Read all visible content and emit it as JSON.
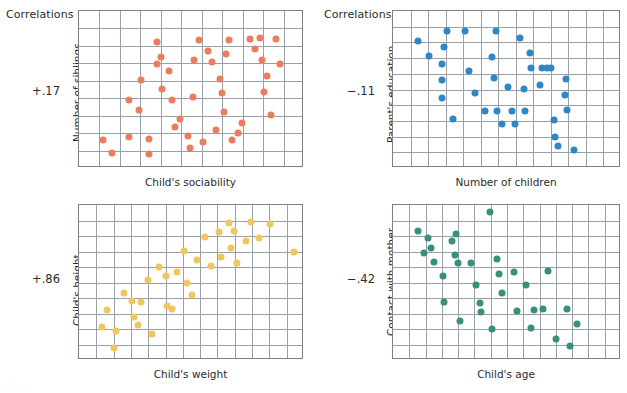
{
  "figure": {
    "caption_label": "Correlations",
    "footer_note": "Figure"
  },
  "colors": {
    "orange": "#EA7D5E",
    "blue": "#2F86C5",
    "yellow": "#F0C65E",
    "green": "#36907A",
    "grid": "#9aa0a8",
    "frame": "#7b8088",
    "text": "#2b2b2b"
  },
  "chart_data": [
    {
      "id": "siblings-vs-sociability",
      "type": "scatter",
      "title": "Correlations",
      "correlation": "+.17",
      "xlabel": "Child's sociability",
      "ylabel": "Number of siblings",
      "grid": true,
      "grid_cols": 11,
      "grid_rows": 9,
      "xlim": [
        0,
        100
      ],
      "ylim": [
        0,
        100
      ],
      "color": "#EA7D5E",
      "points": [
        [
          10.5,
          18.0
        ],
        [
          14.5,
          9.5
        ],
        [
          22.0,
          19.5
        ],
        [
          22.0,
          43.5
        ],
        [
          26.5,
          37.0
        ],
        [
          27.5,
          56.0
        ],
        [
          31.0,
          18.5
        ],
        [
          31.0,
          9.0
        ],
        [
          34.5,
          66.0
        ],
        [
          34.5,
          80.5
        ],
        [
          36.5,
          70.5
        ],
        [
          37.0,
          50.5
        ],
        [
          40.0,
          62.0
        ],
        [
          41.5,
          43.5
        ],
        [
          42.5,
          26.0
        ],
        [
          45.0,
          31.5
        ],
        [
          48.5,
          20.5
        ],
        [
          49.5,
          12.5
        ],
        [
          50.5,
          45.5
        ],
        [
          51.0,
          68.5
        ],
        [
          53.5,
          81.5
        ],
        [
          55.0,
          16.5
        ],
        [
          57.5,
          74.5
        ],
        [
          59.0,
          67.5
        ],
        [
          61.0,
          24.0
        ],
        [
          62.5,
          57.0
        ],
        [
          63.5,
          47.5
        ],
        [
          64.5,
          35.5
        ],
        [
          65.5,
          72.5
        ],
        [
          66.5,
          81.5
        ],
        [
          68.0,
          18.0
        ],
        [
          70.5,
          22.5
        ],
        [
          72.5,
          28.5
        ],
        [
          76.0,
          82.0
        ],
        [
          78.0,
          76.0
        ],
        [
          80.5,
          82.5
        ],
        [
          81.5,
          69.0
        ],
        [
          82.0,
          48.5
        ],
        [
          83.5,
          58.5
        ],
        [
          85.5,
          34.0
        ],
        [
          87.5,
          82.0
        ],
        [
          89.5,
          66.5
        ]
      ]
    },
    {
      "id": "parent-education-vs-children",
      "type": "scatter",
      "title": "Correlations",
      "correlation": "−.11",
      "xlabel": "Number of children",
      "ylabel": "Parent's education",
      "grid": true,
      "grid_cols": 13,
      "grid_rows": 10,
      "xlim": [
        0,
        100
      ],
      "ylim": [
        0,
        100
      ],
      "color": "#2F86C5",
      "points": [
        [
          11.0,
          81.0
        ],
        [
          16.0,
          71.5
        ],
        [
          21.5,
          66.5
        ],
        [
          21.5,
          56.0
        ],
        [
          21.5,
          44.5
        ],
        [
          22.5,
          77.0
        ],
        [
          23.5,
          87.0
        ],
        [
          26.5,
          31.5
        ],
        [
          31.5,
          87.0
        ],
        [
          33.5,
          61.5
        ],
        [
          36.0,
          48.0
        ],
        [
          40.5,
          36.5
        ],
        [
          43.5,
          71.0
        ],
        [
          44.5,
          57.5
        ],
        [
          45.0,
          87.0
        ],
        [
          45.5,
          36.0
        ],
        [
          48.0,
          28.0
        ],
        [
          50.5,
          51.5
        ],
        [
          52.0,
          36.5
        ],
        [
          53.5,
          28.0
        ],
        [
          55.5,
          82.5
        ],
        [
          57.5,
          50.5
        ],
        [
          58.0,
          36.5
        ],
        [
          60.0,
          73.5
        ],
        [
          60.5,
          64.0
        ],
        [
          64.5,
          53.0
        ],
        [
          65.5,
          63.5
        ],
        [
          67.5,
          63.5
        ],
        [
          69.5,
          63.5
        ],
        [
          70.5,
          30.5
        ],
        [
          71.0,
          20.0
        ],
        [
          72.5,
          14.0
        ],
        [
          75.5,
          46.5
        ],
        [
          76.0,
          56.5
        ],
        [
          76.5,
          37.0
        ],
        [
          79.5,
          11.5
        ]
      ]
    },
    {
      "id": "height-vs-weight",
      "type": "scatter",
      "title": "",
      "correlation": "+.86",
      "xlabel": "Child's weight",
      "ylabel": "Child's height",
      "grid": true,
      "grid_cols": 13,
      "grid_rows": 10,
      "xlim": [
        0,
        100
      ],
      "ylim": [
        0,
        100
      ],
      "color": "#F0C65E",
      "points": [
        [
          10.0,
          21.0
        ],
        [
          12.5,
          32.5
        ],
        [
          15.5,
          8.0
        ],
        [
          16.5,
          18.5
        ],
        [
          20.0,
          43.5
        ],
        [
          23.5,
          38.0
        ],
        [
          24.5,
          28.0
        ],
        [
          26.0,
          22.5
        ],
        [
          27.5,
          37.5
        ],
        [
          30.5,
          51.5
        ],
        [
          32.5,
          16.5
        ],
        [
          35.5,
          60.0
        ],
        [
          38.5,
          54.5
        ],
        [
          39.0,
          35.0
        ],
        [
          41.5,
          33.0
        ],
        [
          43.5,
          57.0
        ],
        [
          46.5,
          70.5
        ],
        [
          48.0,
          49.5
        ],
        [
          50.0,
          42.0
        ],
        [
          52.5,
          64.5
        ],
        [
          56.0,
          79.5
        ],
        [
          58.5,
          60.5
        ],
        [
          62.0,
          82.5
        ],
        [
          63.0,
          66.5
        ],
        [
          66.5,
          88.5
        ],
        [
          67.5,
          72.0
        ],
        [
          69.0,
          83.5
        ],
        [
          70.0,
          62.5
        ],
        [
          74.0,
          76.5
        ],
        [
          76.5,
          89.0
        ],
        [
          80.0,
          79.0
        ],
        [
          85.0,
          87.5
        ],
        [
          95.5,
          70.0
        ]
      ]
    },
    {
      "id": "contact-vs-age",
      "type": "scatter",
      "title": "",
      "correlation": "−.42",
      "xlabel": "Child's age",
      "ylabel": "Contact with mother",
      "grid": true,
      "grid_cols": 14,
      "grid_rows": 10,
      "xlim": [
        0,
        100
      ],
      "ylim": [
        0,
        100
      ],
      "color": "#36907A",
      "points": [
        [
          11.0,
          83.5
        ],
        [
          13.5,
          69.0
        ],
        [
          15.5,
          79.0
        ],
        [
          16.5,
          72.0
        ],
        [
          18.0,
          63.5
        ],
        [
          22.0,
          54.0
        ],
        [
          22.5,
          37.5
        ],
        [
          26.0,
          76.5
        ],
        [
          27.0,
          68.0
        ],
        [
          27.5,
          81.5
        ],
        [
          28.5,
          62.5
        ],
        [
          29.5,
          25.0
        ],
        [
          34.0,
          62.5
        ],
        [
          36.5,
          48.5
        ],
        [
          38.0,
          37.0
        ],
        [
          38.5,
          31.0
        ],
        [
          42.5,
          95.5
        ],
        [
          43.5,
          20.0
        ],
        [
          45.5,
          65.0
        ],
        [
          46.5,
          55.5
        ],
        [
          48.0,
          43.5
        ],
        [
          53.0,
          57.0
        ],
        [
          54.5,
          31.5
        ],
        [
          58.5,
          48.5
        ],
        [
          60.5,
          20.5
        ],
        [
          62.0,
          32.0
        ],
        [
          66.0,
          33.0
        ],
        [
          68.0,
          57.5
        ],
        [
          71.5,
          13.5
        ],
        [
          76.5,
          33.0
        ],
        [
          77.5,
          9.0
        ],
        [
          80.5,
          23.0
        ]
      ]
    }
  ]
}
